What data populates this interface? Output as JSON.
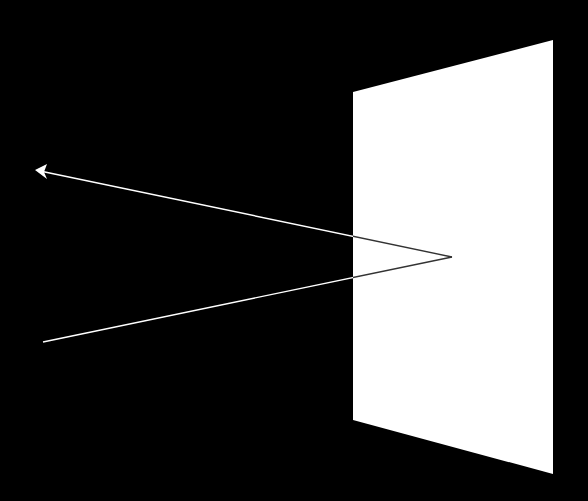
{
  "diagram": {
    "colors": {
      "background": "#000000",
      "plane": "#ffffff",
      "ray_on_dark": "#ffffff",
      "ray_on_plane": "#333333"
    },
    "plane": {
      "points": "353,92 553,40 553,474 353,420"
    },
    "incident_ray": {
      "x1": 43,
      "y1": 342,
      "x2": 452,
      "y2": 257
    },
    "reflected_ray": {
      "x1": 452,
      "y1": 257,
      "x2": 40,
      "y2": 171
    },
    "arrowhead": {
      "points": "35,170 47,164 44,172 47,179"
    }
  }
}
